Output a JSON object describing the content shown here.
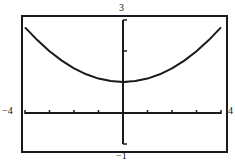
{
  "window": {
    "xmin": "-4",
    "xmax": "4",
    "ymin": "-1",
    "ymax": "3"
  },
  "chart_data": {
    "type": "line",
    "title": "",
    "xlabel": "",
    "ylabel": "",
    "xlim": [
      -4,
      4
    ],
    "ylim": [
      -1,
      3
    ],
    "x_ticks": [
      -4,
      -3,
      -2,
      -1,
      0,
      1,
      2,
      3,
      4
    ],
    "y_ticks": [
      -1,
      0,
      1,
      2,
      3
    ],
    "tick_labels": {
      "left": "-4",
      "right": "4",
      "top": "3",
      "bottom": "-1"
    },
    "grid": false,
    "legend": null,
    "series": [
      {
        "name": "curve",
        "x": [
          -4,
          -3.5,
          -3,
          -2.5,
          -2,
          -1.5,
          -1,
          -0.5,
          0,
          0.5,
          1,
          1.5,
          2,
          2.5,
          3,
          3.5,
          4
        ],
        "y": [
          2.76,
          2.35,
          1.99,
          1.69,
          1.44,
          1.25,
          1.11,
          1.03,
          1.0,
          1.03,
          1.11,
          1.25,
          1.44,
          1.69,
          1.99,
          2.35,
          2.76
        ]
      }
    ],
    "colors": {
      "line": "#1a1a1a",
      "axes": "#1a1a1a",
      "background": "#ffffff"
    }
  }
}
